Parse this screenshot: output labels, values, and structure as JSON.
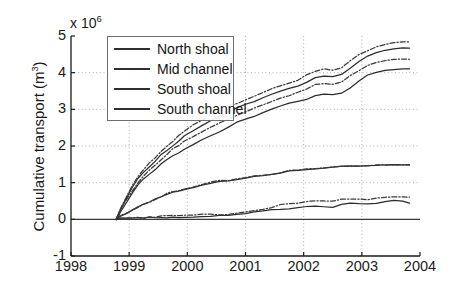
{
  "chart_data": {
    "type": "line",
    "title": "",
    "xlabel": "",
    "ylabel": "Cumulative transport (m",
    "ylabel_sup": "3",
    "ylabel_suffix": ")",
    "exponent_prefix": "x 10",
    "exponent_power": "6",
    "y_scale": 1000000,
    "xlim": [
      1998,
      2004
    ],
    "ylim": [
      -1,
      5
    ],
    "grid": true,
    "legend_position": "upper left",
    "xticks": [
      "1998",
      "1999",
      "2000",
      "2001",
      "2002",
      "2003",
      "2004"
    ],
    "yticks": [
      "5",
      "4",
      "3",
      "2",
      "1",
      "0",
      "-1"
    ],
    "x": [
      1998.78,
      1998.85,
      1998.95,
      1999.05,
      1999.15,
      1999.25,
      1999.35,
      1999.45,
      1999.55,
      1999.65,
      1999.75,
      1999.85,
      1999.95,
      2000.1,
      2000.25,
      2000.4,
      2000.55,
      2000.7,
      2000.85,
      2001.0,
      2001.15,
      2001.3,
      2001.45,
      2001.6,
      2001.75,
      2001.9,
      2002.05,
      2002.2,
      2002.35,
      2002.5,
      2002.65,
      2002.8,
      2002.95,
      2003.1,
      2003.25,
      2003.4,
      2003.55,
      2003.7,
      2003.82
    ],
    "series": [
      {
        "name": "North shoal",
        "style": "solid",
        "color": "#2b2b2b",
        "values": [
          0.0,
          0.02,
          0.03,
          0.02,
          0.04,
          0.03,
          0.05,
          0.04,
          0.06,
          0.05,
          0.06,
          0.05,
          0.07,
          0.06,
          0.08,
          0.07,
          0.09,
          0.1,
          0.12,
          0.15,
          0.19,
          0.22,
          0.25,
          0.28,
          0.3,
          0.33,
          0.36,
          0.38,
          0.36,
          0.34,
          0.39,
          0.43,
          0.42,
          0.41,
          0.43,
          0.47,
          0.5,
          0.48,
          0.45
        ]
      },
      {
        "name": "North shoal (band)",
        "style": "dashdot",
        "color": "#3a3a3a",
        "values": [
          0.0,
          0.03,
          0.05,
          0.04,
          0.06,
          0.05,
          0.07,
          0.06,
          0.08,
          0.07,
          0.09,
          0.08,
          0.1,
          0.09,
          0.12,
          0.12,
          0.14,
          0.16,
          0.19,
          0.22,
          0.27,
          0.3,
          0.34,
          0.37,
          0.4,
          0.43,
          0.47,
          0.5,
          0.48,
          0.46,
          0.52,
          0.57,
          0.56,
          0.55,
          0.58,
          0.62,
          0.64,
          0.62,
          0.58
        ]
      },
      {
        "name": "Mid channel",
        "style": "solid",
        "color": "#2b2b2b",
        "values": [
          0.0,
          0.08,
          0.17,
          0.26,
          0.34,
          0.42,
          0.49,
          0.56,
          0.62,
          0.67,
          0.72,
          0.76,
          0.8,
          0.86,
          0.92,
          0.97,
          1.02,
          1.06,
          1.1,
          1.14,
          1.18,
          1.21,
          1.24,
          1.27,
          1.3,
          1.32,
          1.35,
          1.37,
          1.39,
          1.41,
          1.43,
          1.44,
          1.46,
          1.47,
          1.48,
          1.49,
          1.5,
          1.5,
          1.5
        ]
      },
      {
        "name": "Mid channel (band)",
        "style": "dashdot",
        "color": "#3a3a3a",
        "values": [
          0.0,
          0.09,
          0.18,
          0.27,
          0.35,
          0.43,
          0.5,
          0.57,
          0.63,
          0.68,
          0.73,
          0.77,
          0.81,
          0.87,
          0.93,
          0.98,
          1.03,
          1.07,
          1.11,
          1.15,
          1.19,
          1.22,
          1.25,
          1.28,
          1.31,
          1.33,
          1.36,
          1.38,
          1.4,
          1.42,
          1.44,
          1.45,
          1.47,
          1.48,
          1.49,
          1.5,
          1.51,
          1.51,
          1.51
        ]
      },
      {
        "name": "South shoal",
        "style": "solid",
        "color": "#2b2b2b",
        "values": [
          0.0,
          0.2,
          0.45,
          0.7,
          0.92,
          1.1,
          1.22,
          1.35,
          1.5,
          1.62,
          1.72,
          1.82,
          1.93,
          2.05,
          2.18,
          2.3,
          2.4,
          2.52,
          2.63,
          2.72,
          2.8,
          2.9,
          3.0,
          3.08,
          3.15,
          3.2,
          3.28,
          3.38,
          3.42,
          3.4,
          3.45,
          3.6,
          3.78,
          3.92,
          4.0,
          4.05,
          4.08,
          4.1,
          4.1
        ]
      },
      {
        "name": "South shoal (band)",
        "style": "dashdot",
        "color": "#3a3a3a",
        "values": [
          0.0,
          0.24,
          0.5,
          0.78,
          1.0,
          1.2,
          1.35,
          1.5,
          1.65,
          1.78,
          1.9,
          2.0,
          2.12,
          2.25,
          2.38,
          2.5,
          2.62,
          2.74,
          2.85,
          2.95,
          3.04,
          3.14,
          3.24,
          3.33,
          3.4,
          3.46,
          3.55,
          3.65,
          3.7,
          3.68,
          3.74,
          3.9,
          4.08,
          4.22,
          4.3,
          4.35,
          4.38,
          4.4,
          4.4
        ]
      },
      {
        "name": "South channel",
        "style": "solid",
        "color": "#2b2b2b",
        "values": [
          0.0,
          0.25,
          0.55,
          0.85,
          1.1,
          1.3,
          1.45,
          1.6,
          1.78,
          1.9,
          2.02,
          2.14,
          2.26,
          2.4,
          2.55,
          2.68,
          2.8,
          2.92,
          3.02,
          3.12,
          3.22,
          3.32,
          3.42,
          3.5,
          3.58,
          3.65,
          3.74,
          3.85,
          3.9,
          3.88,
          3.95,
          4.12,
          4.3,
          4.45,
          4.55,
          4.62,
          4.66,
          4.68,
          4.68
        ]
      },
      {
        "name": "South channel (band)",
        "style": "dashdot",
        "color": "#3a3a3a",
        "values": [
          0.0,
          0.28,
          0.6,
          0.92,
          1.18,
          1.38,
          1.55,
          1.7,
          1.88,
          2.02,
          2.15,
          2.28,
          2.4,
          2.55,
          2.7,
          2.84,
          2.96,
          3.08,
          3.18,
          3.28,
          3.38,
          3.48,
          3.58,
          3.67,
          3.75,
          3.82,
          3.92,
          4.03,
          4.08,
          4.06,
          4.13,
          4.3,
          4.48,
          4.63,
          4.73,
          4.8,
          4.84,
          4.86,
          4.86
        ]
      }
    ],
    "legend": [
      {
        "label": "North shoal"
      },
      {
        "label": "Mid channel"
      },
      {
        "label": "South shoal"
      },
      {
        "label": "South channel"
      }
    ]
  }
}
